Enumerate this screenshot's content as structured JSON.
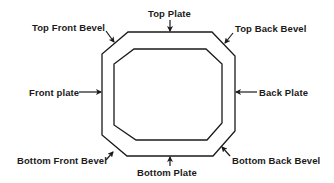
{
  "diagram": {
    "type": "labeled cross-section",
    "shape": "octagonal frame (outer and inner octagon)",
    "stroke_color": "#1a1a1a",
    "background": "#ffffff",
    "labels": {
      "top_plate": "Top Plate",
      "top_front_bevel": "Top Front Bevel",
      "top_back_bevel": "Top Back Bevel",
      "front_plate": "Front plate",
      "back_plate": "Back Plate",
      "bottom_front_bevel": "Bottom Front Bevel",
      "bottom_plate": "Bottom Plate",
      "bottom_back_bevel": "Bottom Back Bevel"
    },
    "outer_octagon": [
      [
        128,
        32
      ],
      [
        212,
        32
      ],
      [
        235,
        56
      ],
      [
        235,
        131
      ],
      [
        213,
        156
      ],
      [
        127,
        156
      ],
      [
        102,
        135
      ],
      [
        102,
        54
      ]
    ],
    "inner_octagon": [
      [
        134,
        49
      ],
      [
        206,
        49
      ],
      [
        222,
        64
      ],
      [
        222,
        123
      ],
      [
        207,
        140
      ],
      [
        136,
        140
      ],
      [
        114,
        125
      ],
      [
        114,
        64
      ]
    ]
  }
}
